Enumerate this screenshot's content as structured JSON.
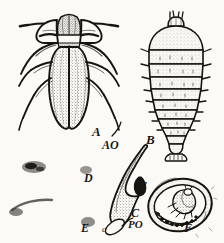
{
  "plate": {
    "background_color": "#fbfaf6",
    "ink_color": "#1a1713",
    "labels": [
      {
        "key": "A",
        "text": "A",
        "figure": "adult-beetle-dorsal"
      },
      {
        "key": "AO",
        "text": "AO",
        "figure": "adult-beetle-pointer"
      },
      {
        "key": "B",
        "text": "B",
        "figure": "larva-dorsal"
      },
      {
        "key": "D",
        "text": "D",
        "figure": "stippled-mound-upper"
      },
      {
        "key": "E",
        "text": "E",
        "figure": "stippled-mound-lower"
      },
      {
        "key": "c",
        "text": "c",
        "figure": "crescent-detail-marker"
      },
      {
        "key": "T",
        "text": "T",
        "figure": "crescent-inner-marker"
      },
      {
        "key": "C",
        "text": "C",
        "figure": "crescent-structure"
      },
      {
        "key": "PO",
        "text": "PO",
        "figure": "crescent-base-marker"
      },
      {
        "key": "F",
        "text": "F",
        "figure": "pupal-cell-with-pupa"
      }
    ]
  }
}
